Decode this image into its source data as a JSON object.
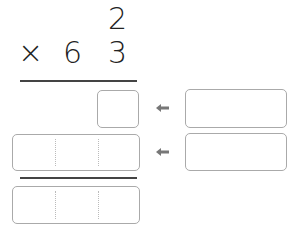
{
  "problem": {
    "multiplicand": "2",
    "operator": "×",
    "multiplier_tens": "6",
    "multiplier_ones": "3"
  },
  "answer_boxes": {
    "partial_product_1": "",
    "partial_product_2": "",
    "final_product": "",
    "helper_1": "",
    "helper_2": ""
  },
  "icons": {
    "arrow_1": "arrow-left-icon",
    "arrow_2": "arrow-left-icon"
  },
  "colors": {
    "digit": "#222222",
    "rule": "#444444",
    "box_border": "#aaaaaa",
    "arrow": "#777777"
  }
}
